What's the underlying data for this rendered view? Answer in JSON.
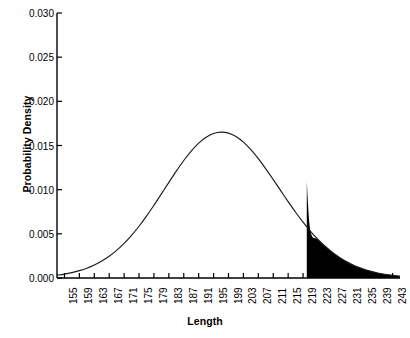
{
  "chart_data": {
    "type": "line",
    "title": "",
    "xlabel": "Length",
    "ylabel": "Probability Density",
    "xlim": [
      153,
      245
    ],
    "ylim": [
      0.0,
      0.03
    ],
    "grid": false,
    "legend": null,
    "distribution": {
      "family": "normal",
      "mean": 200,
      "std_dev": 15,
      "peak_density": 0.0266,
      "peak_x": 200
    },
    "shaded_region": {
      "label": "upper tail",
      "from_x": 220,
      "to_x": 245,
      "density_at_from_x": 0.0109,
      "fill_color": "#000000"
    },
    "xticks": [
      155,
      159,
      163,
      167,
      171,
      175,
      179,
      183,
      187,
      191,
      195,
      199,
      203,
      207,
      211,
      215,
      219,
      223,
      227,
      231,
      235,
      239,
      243
    ],
    "yticks": [
      0.0,
      0.005,
      0.01,
      0.015,
      0.02,
      0.025,
      0.03
    ],
    "ytick_labels": [
      "0.000",
      "0.005",
      "0.010",
      "0.015",
      "0.020",
      "0.025",
      "0.030"
    ],
    "xtick_labels": [
      "155",
      "159",
      "163",
      "167",
      "171",
      "175",
      "179",
      "183",
      "187",
      "191",
      "195",
      "199",
      "203",
      "207",
      "211",
      "215",
      "219",
      "223",
      "227",
      "231",
      "235",
      "239",
      "243"
    ],
    "series": [
      {
        "name": "Probability Density",
        "color": "#1a1a1a",
        "x": [
          153,
          155,
          157,
          159,
          161,
          163,
          165,
          167,
          169,
          171,
          173,
          175,
          177,
          179,
          181,
          183,
          185,
          187,
          189,
          191,
          193,
          195,
          197,
          199,
          201,
          203,
          205,
          207,
          209,
          211,
          213,
          215,
          217,
          219,
          221,
          223,
          225,
          227,
          229,
          231,
          233,
          235,
          237,
          239,
          241,
          243,
          245
        ],
        "values": [
          0.00032,
          0.00044,
          0.00061,
          0.00083,
          0.00111,
          0.00147,
          0.00192,
          0.00247,
          0.00313,
          0.00392,
          0.00483,
          0.00586,
          0.007,
          0.00823,
          0.00952,
          0.01082,
          0.0121,
          0.0133,
          0.01437,
          0.01526,
          0.01593,
          0.01636,
          0.01651,
          0.0164,
          0.01601,
          0.01538,
          0.01453,
          0.01351,
          0.01236,
          0.01114,
          0.00989,
          0.00864,
          0.00744,
          0.00632,
          0.00529,
          0.00437,
          0.00356,
          0.00286,
          0.00227,
          0.00177,
          0.00136,
          0.00104,
          0.00078,
          0.00057,
          0.00042,
          0.0003,
          0.00021
        ]
      }
    ],
    "axes_style": {
      "spines": [
        "left",
        "bottom"
      ],
      "tick_direction": "in",
      "xtick_label_rotation": 90
    }
  },
  "caption": ""
}
